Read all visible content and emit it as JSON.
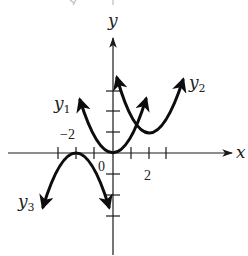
{
  "figure": {
    "type": "coordinate-graph",
    "axes": {
      "x_label": "x",
      "y_label": "y",
      "origin_label": "0",
      "tick_labels": {
        "x_positive": "2",
        "x_negative": "−2"
      }
    },
    "curves": [
      {
        "id": "y1",
        "name": "y",
        "subscript": "1",
        "shape": "upward parabola",
        "vertex": [
          0,
          0
        ]
      },
      {
        "id": "y2",
        "name": "y",
        "subscript": "2",
        "shape": "upward parabola",
        "vertex": [
          2,
          1
        ]
      },
      {
        "id": "y3",
        "name": "y",
        "subscript": "3",
        "shape": "downward parabola",
        "vertex": [
          -2,
          0
        ]
      }
    ],
    "colors": {
      "ink": "#0d0d0d",
      "background": "#ffffff"
    }
  }
}
